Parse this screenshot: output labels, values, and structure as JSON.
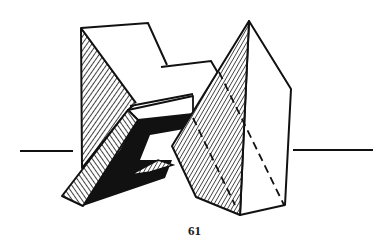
{
  "page": {
    "page_number": "61"
  },
  "figure": {
    "colors": {
      "ink": "#111111",
      "paper": "#ffffff"
    },
    "elements": [
      "horizon-line-left",
      "horizon-line-right",
      "stepped-block",
      "slanted-bar-with-shadow",
      "pyramid-with-hidden-edges"
    ]
  }
}
